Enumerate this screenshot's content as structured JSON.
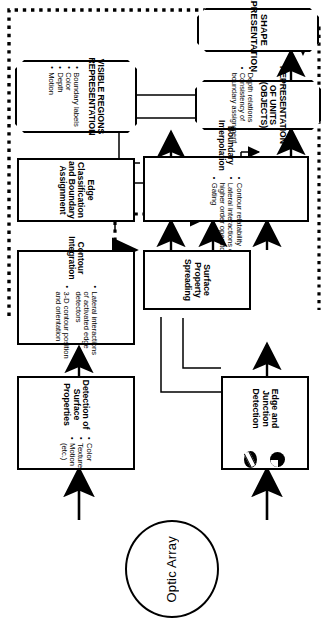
{
  "diagram": {
    "orientation": "rotated-90-clockwise",
    "colors": {
      "stroke": "#000000",
      "fill": "#ffffff"
    },
    "source": {
      "label": "Optic Array",
      "shape": "ellipse"
    },
    "nodes": [
      {
        "id": "edge_junction_detection",
        "title": "Edge and Junction\nDetection",
        "title_lines": [
          "Edge and Junction",
          "Detection"
        ],
        "shape": "rect",
        "icons": [
          "junction-circle-icon",
          "edge-circle-icon"
        ],
        "bullets": []
      },
      {
        "id": "contour_integration",
        "title": "Contour Integration",
        "title_lines": [
          "Contour Integration"
        ],
        "shape": "rect",
        "bullets": [
          "Lateral interactions",
          "of activated edge",
          "detectors",
          "3-D contour position",
          "and orientation"
        ],
        "bullet_marks": [
          true,
          false,
          false,
          true,
          false
        ]
      },
      {
        "id": "boundary_interpolation",
        "title": "Boundary Interpolation",
        "title_lines": [
          "Boundary Interpolation"
        ],
        "shape": "rect",
        "bullets": [
          "Contour relatability",
          "Lateral interactions or",
          "higher order operators",
          "Gating"
        ],
        "bullet_marks": [
          true,
          true,
          false,
          true
        ]
      },
      {
        "id": "edge_classification",
        "title": "Edge Classification and Boundary Assignment",
        "title_lines": [
          "Edge Classification",
          "and Boundary",
          "Assignment"
        ],
        "shape": "rect",
        "bullets": []
      },
      {
        "id": "representation_of_units",
        "title": "REPRESENTATION OF UNITS (OBJECTS)",
        "title_lines": [
          "REPRESENTATION",
          "OF UNITS (OBJECTS)"
        ],
        "shape": "octagon",
        "bullets": [
          "Depth relations",
          "Consistency of",
          "boundary assignment"
        ],
        "bullet_marks": [
          true,
          true,
          false
        ]
      },
      {
        "id": "shape_representation",
        "title": "SHAPE REPRESENTATION",
        "title_lines": [
          "SHAPE",
          "REPRESENTATION"
        ],
        "shape": "octagon",
        "bullets": []
      },
      {
        "id": "surface_property_spreading",
        "title": "Surface Property Spreading",
        "title_lines": [
          "Surface Property",
          "Spreading"
        ],
        "shape": "rect",
        "bullets": []
      },
      {
        "id": "visible_regions",
        "title": "VISIBLE REGIONS REPRESENTATION",
        "title_lines": [
          "VISIBLE REGIONS",
          "REPRESENTATION"
        ],
        "shape": "octagon",
        "bullets": [
          "Boundary labels",
          "Color",
          "Depth",
          "Motion"
        ],
        "bullet_marks": [
          true,
          true,
          true,
          true
        ]
      },
      {
        "id": "detection_surface_properties",
        "title": "Detection of Surface Properties",
        "title_lines": [
          "Detection of",
          "Surface Properties"
        ],
        "shape": "rect",
        "bullets": [
          "Color",
          "Texture",
          "Motion",
          "(etc.)"
        ],
        "bullet_marks": [
          true,
          true,
          true,
          false
        ]
      }
    ],
    "edges": [
      {
        "from": "optic_array",
        "to": "edge_junction_detection",
        "style": "solid-thick"
      },
      {
        "from": "optic_array",
        "to": "detection_surface_properties",
        "style": "solid-thick"
      },
      {
        "from": "edge_junction_detection",
        "to": "contour_integration",
        "style": "solid"
      },
      {
        "from": "edge_junction_detection",
        "to": "edge_classification",
        "style": "solid"
      },
      {
        "from": "contour_integration",
        "to": "boundary_interpolation",
        "style": "solid"
      },
      {
        "from": "contour_integration",
        "to": "edge_classification",
        "style": "solid"
      },
      {
        "from": "edge_classification",
        "to": "visible_regions",
        "style": "solid"
      },
      {
        "from": "edge_classification",
        "to": "boundary_interpolation",
        "style": "solid"
      },
      {
        "from": "edge_classification",
        "to": "representation_of_units",
        "style": "solid"
      },
      {
        "from": "boundary_interpolation",
        "to": "representation_of_units",
        "style": "solid"
      },
      {
        "from": "boundary_interpolation",
        "to": "surface_property_spreading",
        "style": "solid"
      },
      {
        "from": "detection_surface_properties",
        "to": "visible_regions",
        "style": "solid"
      },
      {
        "from": "visible_regions",
        "to": "surface_property_spreading",
        "style": "dotted"
      },
      {
        "from": "surface_property_spreading",
        "to": "boundary_interpolation",
        "style": "solid"
      },
      {
        "from": "surface_property_spreading",
        "to": "representation_of_units",
        "style": "solid"
      },
      {
        "from": "representation_of_units",
        "to": "shape_representation",
        "style": "solid"
      },
      {
        "from": "visible_regions",
        "to": "shape_representation",
        "style": "dotted"
      },
      {
        "from": "shape_representation",
        "to": "edge_classification",
        "style": "dotted-feedback"
      }
    ]
  }
}
